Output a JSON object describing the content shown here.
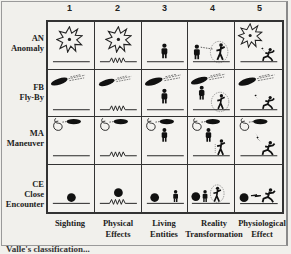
{
  "diagram": {
    "column_numbers": [
      "1",
      "2",
      "3",
      "4",
      "5"
    ],
    "columns": [
      {
        "number": "1",
        "label_line1": "Sighting",
        "label_line2": ""
      },
      {
        "number": "2",
        "label_line1": "Physical",
        "label_line2": "Effects"
      },
      {
        "number": "3",
        "label_line1": "Living",
        "label_line2": "Entities"
      },
      {
        "number": "4",
        "label_line1": "Reality",
        "label_line2": "Transformation"
      },
      {
        "number": "5",
        "label_line1": "Physiological",
        "label_line2": "Effect"
      }
    ],
    "rows": [
      {
        "code": "AN",
        "name_line1": "Anomaly",
        "name_line2": "",
        "base_icon": "star-burst-icon"
      },
      {
        "code": "FB",
        "name_line1": "Fly-By",
        "name_line2": "",
        "base_icon": "flying-disc-icon"
      },
      {
        "code": "MA",
        "name_line1": "Maneuver",
        "name_line2": "",
        "base_icon": "looping-disc-icon"
      },
      {
        "code": "CE",
        "name_line1": "Close",
        "name_line2": "Encounter",
        "base_icon": "landed-sphere-icon"
      }
    ],
    "cell_icon_legend": {
      "col1": "flat ground line",
      "col2": "zigzag ground line (physical effect)",
      "col3": "standing figure (living entity)",
      "col4": "figure in circle with dotted beam (reality transformation)",
      "col5": "lightning bolt striking crouching figure (physiological effect)"
    },
    "caption_partial": "Valle's classification..."
  },
  "colors": {
    "background": "#f1f0ec",
    "ink": "#222222",
    "grid_line": "#333333"
  }
}
